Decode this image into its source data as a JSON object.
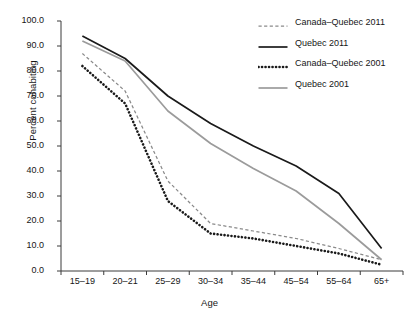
{
  "chart_data": {
    "type": "line",
    "title": "",
    "xlabel": "Age",
    "ylabel": "Percent cohabiting",
    "categories": [
      "15–19",
      "20–21",
      "25–29",
      "30–34",
      "35–44",
      "45–54",
      "55–64",
      "65+"
    ],
    "yticks": [
      "0.0",
      "10.0",
      "20.0",
      "30.0",
      "40.0",
      "50.0",
      "60.0",
      "70.0",
      "80.0",
      "90.0",
      "100.0"
    ],
    "ylim": [
      0,
      100
    ],
    "grid": false,
    "legend_position": "top-right",
    "series": [
      {
        "name": "Canada–Quebec 2011",
        "style": "dashed",
        "color": "#8a8a8a",
        "values": [
          87.0,
          72.0,
          36.0,
          19.0,
          16.0,
          13.0,
          9.0,
          4.5
        ]
      },
      {
        "name": "Quebec 2011",
        "style": "solid",
        "color": "#1a1a1a",
        "values": [
          94.0,
          85.0,
          70.0,
          59.0,
          50.0,
          42.0,
          31.0,
          9.0
        ]
      },
      {
        "name": "Canada–Quebec 2001",
        "style": "dotted",
        "color": "#1a1a1a",
        "values": [
          82.0,
          67.0,
          28.0,
          15.0,
          13.0,
          10.0,
          7.0,
          2.5
        ]
      },
      {
        "name": "Quebec 2001",
        "style": "solid",
        "color": "#9b9b9b",
        "values": [
          92.0,
          84.0,
          64.0,
          51.0,
          41.0,
          32.0,
          19.0,
          4.5
        ]
      }
    ]
  }
}
